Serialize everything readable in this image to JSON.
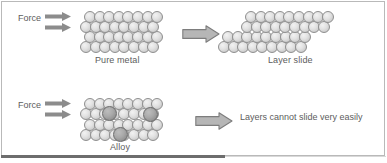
{
  "figure": {
    "background_color": "#ffffff",
    "border_color": "#b9b9b9",
    "atom_color": "#e2e2e2",
    "dopant_color": "#a9a9a9",
    "arrow_color": "#8c8c8c",
    "text_color": "#5d5d5d"
  },
  "panels": {
    "pure_metal": {
      "force_label": "Force",
      "caption": "Pure metal",
      "result_caption": "Layer slide"
    },
    "alloy": {
      "force_label": "Force",
      "caption": "Alloy",
      "result_text": "Layers cannot slide very easily"
    }
  },
  "lattices": {
    "pure_metal": {
      "rows": [
        {
          "y": 11,
          "x": 84,
          "count": 8,
          "offset": 0
        },
        {
          "y": 21,
          "x": 80,
          "count": 8,
          "offset": 0
        },
        {
          "y": 31,
          "x": 84,
          "count": 8,
          "offset": 0
        },
        {
          "y": 41,
          "x": 80,
          "count": 8,
          "offset": 0
        }
      ]
    },
    "layer_slide": {
      "rows": [
        {
          "y": 11,
          "x": 245,
          "count": 9,
          "offset": 0
        },
        {
          "y": 21,
          "x": 241,
          "count": 9,
          "offset": 0
        },
        {
          "y": 31,
          "x": 222,
          "count": 9,
          "offset": 0
        },
        {
          "y": 41,
          "x": 218,
          "count": 9,
          "offset": 0
        }
      ]
    },
    "alloy": {
      "rows": [
        {
          "y": 98,
          "x": 84,
          "count": 8,
          "offset": 0
        },
        {
          "y": 108,
          "x": 80,
          "count": 8,
          "offset": 0
        },
        {
          "y": 119,
          "x": 84,
          "count": 8,
          "offset": 0
        },
        {
          "y": 129,
          "x": 80,
          "count": 8,
          "offset": 0
        }
      ],
      "dopants": [
        {
          "x": 102,
          "y": 106
        },
        {
          "x": 143,
          "y": 107
        },
        {
          "x": 113,
          "y": 127
        }
      ]
    }
  },
  "arrows": {
    "force_pure": [
      {
        "x": 45,
        "y": 12
      },
      {
        "x": 45,
        "y": 23
      }
    ],
    "force_alloy": [
      {
        "x": 45,
        "y": 99
      },
      {
        "x": 45,
        "y": 110
      }
    ],
    "transition_top": {
      "x": 182,
      "y": 25
    },
    "transition_bottom": {
      "x": 195,
      "y": 112
    }
  },
  "labels": {
    "force_pure": {
      "x": 18,
      "y": 13
    },
    "force_alloy": {
      "x": 18,
      "y": 100
    },
    "pure_metal": {
      "x": 95,
      "y": 55
    },
    "layer_slide": {
      "x": 268,
      "y": 55
    },
    "alloy": {
      "x": 110,
      "y": 142
    },
    "cannot_slide": {
      "x": 240,
      "y": 112
    }
  }
}
